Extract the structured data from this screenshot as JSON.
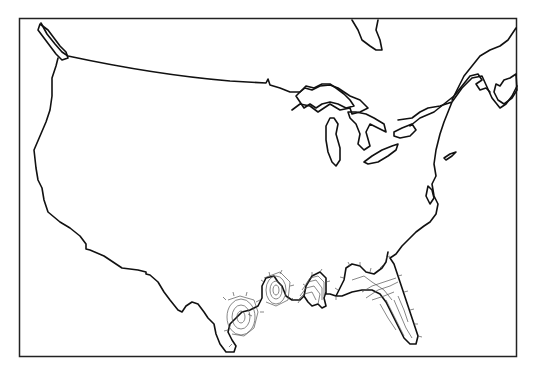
{
  "map": {
    "title": "",
    "region": "Contiguous United States",
    "style": "outline map, black line art on white",
    "colors": {
      "background": "#ffffff",
      "outline": "#111111",
      "contours": "#555555",
      "frame": "#222222"
    },
    "frame": {
      "left": 19,
      "top": 18,
      "right": 517,
      "bottom": 356
    },
    "features": [
      {
        "name": "us-outline",
        "type": "coastline-and-borders"
      },
      {
        "name": "great-lakes",
        "type": "water-bodies"
      },
      {
        "name": "hudson-bay-fragment",
        "type": "coastline"
      },
      {
        "name": "gulf-coast-contours",
        "type": "isolines",
        "location": "Texas, Louisiana, Mississippi, Alabama, Florida panhandle and peninsula"
      }
    ],
    "labels": []
  }
}
